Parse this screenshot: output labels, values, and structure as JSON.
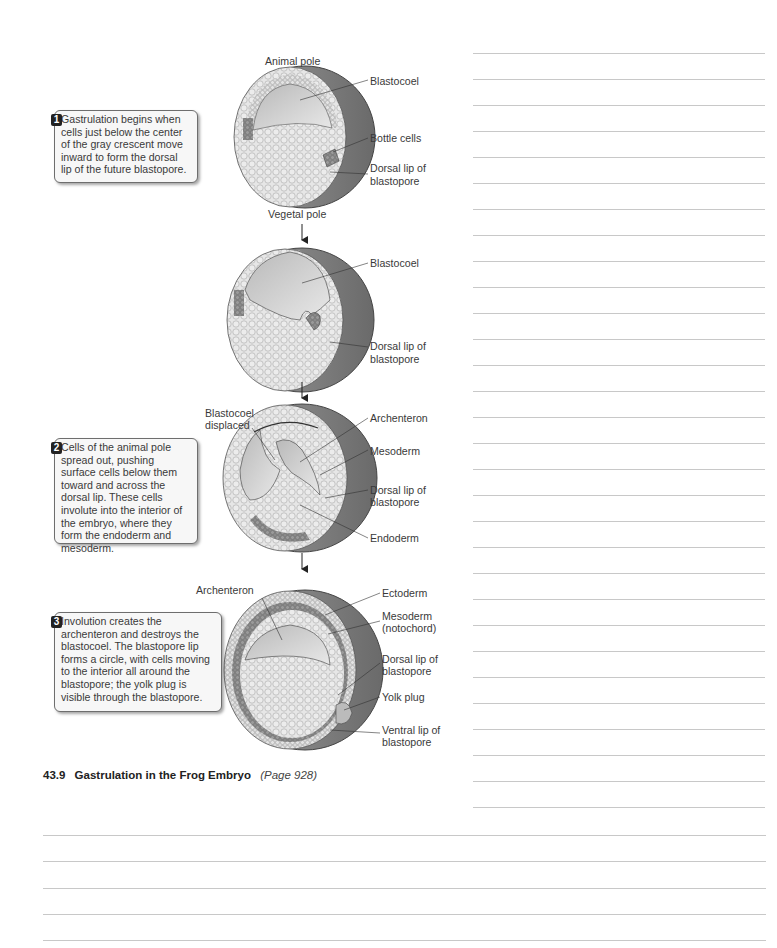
{
  "figure": {
    "number": "43.9",
    "title": "Gastrulation in the Frog Embryo",
    "page_ref": "(Page 928)"
  },
  "callouts": [
    {
      "number": "1",
      "text": "Gastrulation begins when cells just below the center of the gray crescent move inward to form the dorsal lip of the future blastopore."
    },
    {
      "number": "2",
      "text": "Cells of the animal pole spread out, pushing surface cells below them toward and across the dorsal lip. These cells involute into the interior of the embryo, where they form the endoderm and mesoderm."
    },
    {
      "number": "3",
      "text": "Involution creates the archenteron and destroys the blastocoel. The blastopore lip forms a circle, with cells moving to the interior all around the blastopore; the yolk plug is visible through the blastopore."
    }
  ],
  "stages": [
    {
      "labels": {
        "top": "Animal pole",
        "bottom": "Vegetal pole",
        "right": [
          "Blastocoel",
          "Bottle cells",
          "Dorsal lip of\nblastopore"
        ]
      }
    },
    {
      "labels": {
        "right": [
          "Blastocoel",
          "Dorsal lip of\nblastopore"
        ]
      }
    },
    {
      "labels": {
        "left": "Blastocoel\ndisplaced",
        "right": [
          "Archenteron",
          "Mesoderm",
          "Dorsal lip of\nblastopore",
          "Endoderm"
        ]
      }
    },
    {
      "labels": {
        "left": "Archenteron",
        "right": [
          "Ectoderm",
          "Mesoderm\n(notochord)",
          "Dorsal lip of\nblastopore",
          "Yolk plug",
          "Ventral lip of\nblastopore"
        ]
      }
    }
  ],
  "s1": {
    "animal": "Animal pole",
    "vegetal": "Vegetal pole",
    "blastocoel": "Blastocoel",
    "bottle": "Bottle cells",
    "dorsal1": "Dorsal lip of",
    "dorsal2": "blastopore"
  },
  "s2": {
    "blastocoel": "Blastocoel",
    "dorsal1": "Dorsal lip of",
    "dorsal2": "blastopore"
  },
  "s3": {
    "displaced1": "Blastocoel",
    "displaced2": "displaced",
    "archenteron": "Archenteron",
    "mesoderm": "Mesoderm",
    "dorsal1": "Dorsal lip of",
    "dorsal2": "blastopore",
    "endoderm": "Endoderm"
  },
  "s4": {
    "archenteron": "Archenteron",
    "ectoderm": "Ectoderm",
    "mesoderm1": "Mesoderm",
    "mesoderm2": "(notochord)",
    "dorsal1": "Dorsal lip of",
    "dorsal2": "blastopore",
    "yolk": "Yolk plug",
    "ventral1": "Ventral lip of",
    "ventral2": "blastopore"
  },
  "note_lines": {
    "right_column_count": 30,
    "bottom_full_width_count": 5
  },
  "colors": {
    "rule": "#c8c8c8",
    "callout_bg": "#f7f7f7",
    "callout_border": "#6e6e6e",
    "badge": "#222222"
  }
}
